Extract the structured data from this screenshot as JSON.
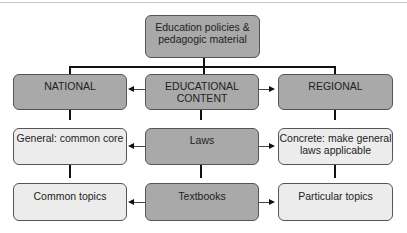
{
  "diagram": {
    "root": {
      "label_line1": "Education policies &",
      "label_line2": "pedagogic material"
    },
    "level1": {
      "national": {
        "label": "NATIONAL"
      },
      "educational_content": {
        "label_line1": "EDUCATIONAL",
        "label_line2": "CONTENT"
      },
      "regional": {
        "label": "REGIONAL"
      }
    },
    "level2": {
      "national": {
        "label": "General: common core"
      },
      "center": {
        "label": "Laws"
      },
      "regional": {
        "label_line1": "Concrete: make general",
        "label_line2": "laws applicable"
      }
    },
    "level3": {
      "national": {
        "label": "Common topics"
      },
      "center": {
        "label": "Textbooks"
      },
      "regional": {
        "label": "Particular topics"
      }
    },
    "colors": {
      "dark_box": "#a9a9a9",
      "light_box": "#ececec",
      "border": "#555555",
      "line": "#111111"
    }
  }
}
